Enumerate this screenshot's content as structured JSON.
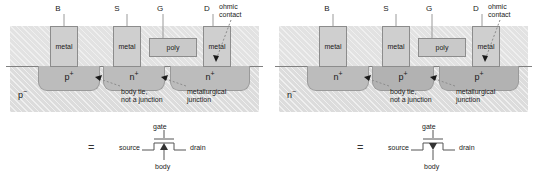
{
  "figure": {
    "panels": [
      {
        "id": "nmos",
        "terminals": [
          {
            "name": "B",
            "label": "B"
          },
          {
            "name": "S",
            "label": "S"
          },
          {
            "name": "G",
            "label": "G"
          },
          {
            "name": "D",
            "label": "D"
          }
        ],
        "ohmic_contact": "ohmic\ncontact",
        "ohmic_contact_line1": "ohmic",
        "ohmic_contact_line2": "contact",
        "contacts": [
          {
            "name": "body-contact",
            "label": "metal"
          },
          {
            "name": "source-contact",
            "label": "metal"
          },
          {
            "name": "gate-electrode",
            "label": "poly"
          },
          {
            "name": "drain-contact",
            "label": "metal"
          }
        ],
        "wells": [
          {
            "name": "body-tie-well",
            "type": "p",
            "label": "p",
            "sup": "+"
          },
          {
            "name": "source-well",
            "type": "n",
            "label": "n",
            "sup": "+"
          },
          {
            "name": "drain-well",
            "type": "n",
            "label": "n",
            "sup": "+"
          }
        ],
        "substrate": {
          "label": "p",
          "sup": "−"
        },
        "callouts": [
          {
            "name": "body-tie-callout",
            "line1": "body tie,",
            "line2": "not a junction"
          },
          {
            "name": "metallurgical-junction-callout",
            "line1": "metallurgical",
            "line2": "junction"
          }
        ],
        "symbol": {
          "equals": "=",
          "gate": "gate",
          "source": "source",
          "drain": "drain",
          "body": "body",
          "arrow": "up"
        }
      },
      {
        "id": "pmos",
        "terminals": [
          {
            "name": "B",
            "label": "B"
          },
          {
            "name": "S",
            "label": "S"
          },
          {
            "name": "G",
            "label": "G"
          },
          {
            "name": "D",
            "label": "D"
          }
        ],
        "ohmic_contact_line1": "ohmic",
        "ohmic_contact_line2": "contact",
        "contacts": [
          {
            "name": "body-contact",
            "label": "metal"
          },
          {
            "name": "source-contact",
            "label": "metal"
          },
          {
            "name": "gate-electrode",
            "label": "poly"
          },
          {
            "name": "drain-contact",
            "label": "metal"
          }
        ],
        "wells": [
          {
            "name": "body-tie-well",
            "type": "n",
            "label": "n",
            "sup": "+"
          },
          {
            "name": "source-well",
            "type": "p",
            "label": "p",
            "sup": "+"
          },
          {
            "name": "drain-well",
            "type": "p",
            "label": "p",
            "sup": "+"
          }
        ],
        "substrate": {
          "label": "n",
          "sup": "−"
        },
        "callouts": [
          {
            "name": "body-tie-callout",
            "line1": "body tie,",
            "line2": "not a junction"
          },
          {
            "name": "metallurgical-junction-callout",
            "line1": "metallurgical",
            "line2": "junction"
          }
        ],
        "symbol": {
          "equals": "=",
          "gate": "gate",
          "source": "source",
          "drain": "drain",
          "body": "body",
          "arrow": "down"
        }
      }
    ],
    "colors": {
      "oxide": "#e2e2e2",
      "bulk": "#dcdcdc",
      "well": "#bcbcbc",
      "metal": "#cfcfcf",
      "poly": "#c9c9c9",
      "outline": "#8c8c8c",
      "text": "#1a1a1a"
    }
  }
}
